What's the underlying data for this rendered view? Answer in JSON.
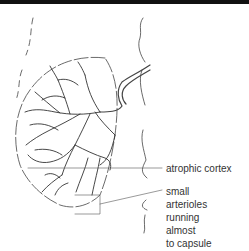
{
  "figure": {
    "labels": {
      "atrophic_cortex": "atrophic cortex",
      "small_arterioles": [
        "small",
        "arterioles",
        "running",
        "almost",
        "to capsule"
      ]
    }
  }
}
